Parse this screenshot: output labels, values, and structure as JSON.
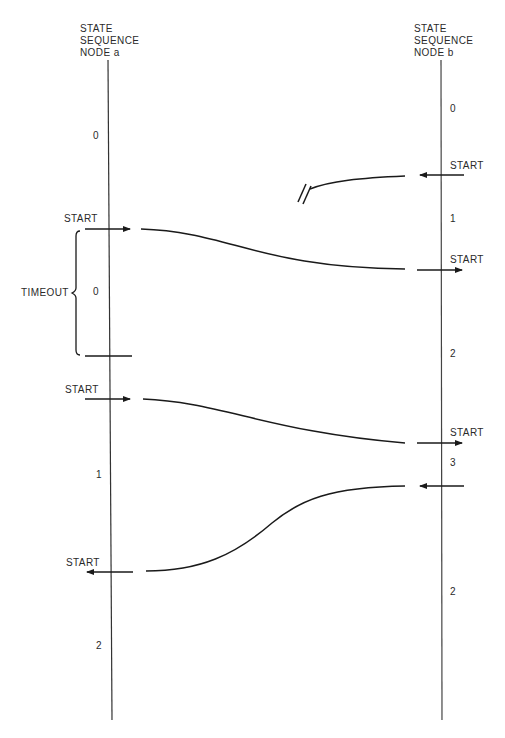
{
  "node_a": {
    "header": [
      "STATE",
      "SEQUENCE",
      "NODE a"
    ],
    "states": [
      "0",
      "0",
      "1",
      "2"
    ],
    "timeout_label": "TIMEOUT",
    "start_labels": [
      "START",
      "START",
      "START"
    ]
  },
  "node_b": {
    "header": [
      "STATE",
      "SEQUENCE",
      "NODE b"
    ],
    "states": [
      "0",
      "1",
      "2",
      "3",
      "2"
    ],
    "start_labels": [
      "START",
      "START",
      "START"
    ]
  },
  "messages": [
    {
      "from": "b",
      "to": "a",
      "label": "START",
      "note": "lost (blocked before reaching node a)"
    },
    {
      "from": "a",
      "to": "b",
      "label": "START"
    },
    {
      "from": "a",
      "to": "b",
      "label": "START"
    },
    {
      "from": "b",
      "to": "a",
      "label": "START"
    }
  ],
  "colors": {
    "line": "#1a1a1a",
    "text": "#2a2a2a",
    "background": "#ffffff"
  }
}
